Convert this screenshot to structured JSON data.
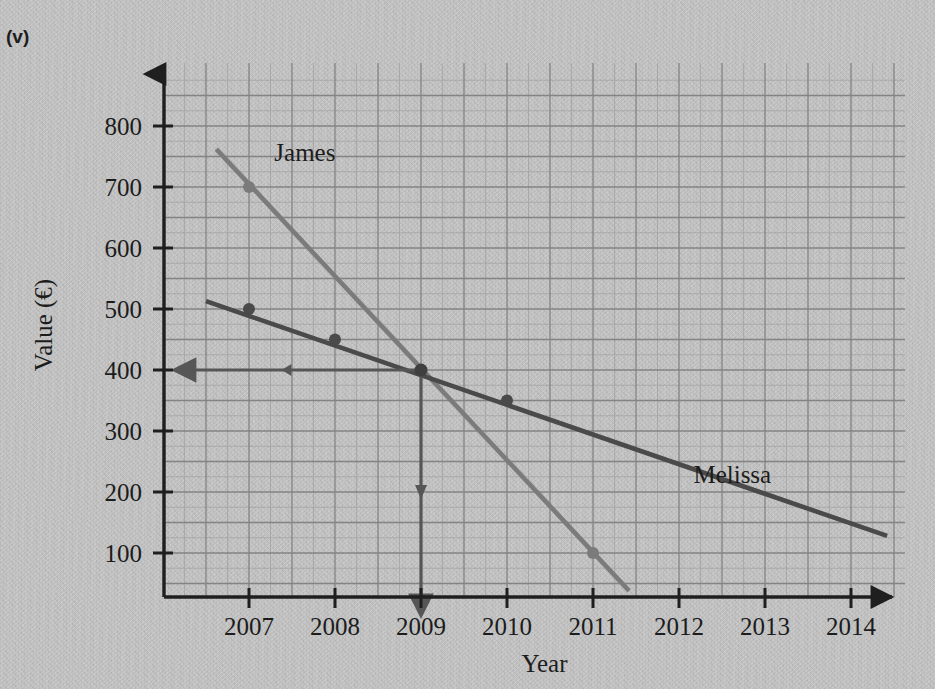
{
  "question_label": "(v)",
  "chart_data": {
    "type": "line",
    "title": "",
    "xlabel": "Year",
    "ylabel": "Value (€)",
    "xlim": [
      2006.15,
      2014.75
    ],
    "ylim": [
      0,
      870
    ],
    "xticks": [
      "2007",
      "2008",
      "2009",
      "2010",
      "2011",
      "2012",
      "2013",
      "2014"
    ],
    "xtick_values": [
      2007,
      2008,
      2009,
      2010,
      2011,
      2012,
      2013,
      2014
    ],
    "yticks": [
      "100",
      "200",
      "300",
      "400",
      "500",
      "600",
      "700",
      "800"
    ],
    "ytick_values": [
      100,
      200,
      300,
      400,
      500,
      600,
      700,
      800
    ],
    "grid": true,
    "grid_minor_step_x": 0.25,
    "grid_minor_step_y": 25,
    "grid_major_step_x": 0.5,
    "grid_major_step_y": 50,
    "legend_position": "inline-labels",
    "series": [
      {
        "name": "James",
        "color": "#7b7b7b",
        "label_x": 2007.65,
        "label_y": 742,
        "line_start": [
          2006.62,
          762
        ],
        "line_end": [
          2011.42,
          38
        ],
        "points": [
          {
            "x": 2007,
            "y": 700
          },
          {
            "x": 2009,
            "y": 400
          },
          {
            "x": 2011,
            "y": 100
          }
        ]
      },
      {
        "name": "Melissa",
        "color": "#4a4a4a",
        "label_x": 2012.62,
        "label_y": 215,
        "line_start": [
          2006.5,
          513
        ],
        "line_end": [
          2014.42,
          128
        ],
        "points": [
          {
            "x": 2007,
            "y": 500
          },
          {
            "x": 2008,
            "y": 450
          },
          {
            "x": 2009,
            "y": 400
          },
          {
            "x": 2010,
            "y": 350
          }
        ]
      }
    ],
    "annotations": [
      {
        "name": "intersection-point",
        "x": 2009,
        "y": 400,
        "note": "Lines cross at year 2009, value 400"
      },
      {
        "name": "horizontal-construction-arrow",
        "from": [
          2009,
          400
        ],
        "to": [
          2006.15,
          400
        ],
        "direction": "left"
      },
      {
        "name": "vertical-construction-arrow",
        "from": [
          2009,
          400
        ],
        "to": [
          2009,
          0
        ],
        "direction": "down"
      }
    ]
  }
}
